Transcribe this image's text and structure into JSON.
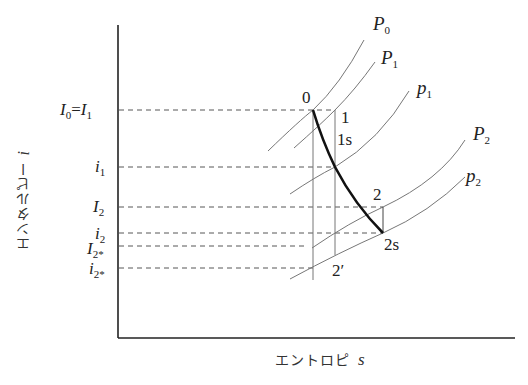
{
  "diagram": {
    "type": "enthalpy-entropy (i-s) diagram",
    "axes": {
      "y_label": "エンタルピー",
      "y_symbol": "i",
      "x_label": "エントロピ",
      "x_symbol": "s"
    },
    "y_levels": [
      {
        "id": "I0_I1",
        "label_main": "I",
        "sub1": "0",
        "eq": "=",
        "label_main2": "I",
        "sub2": "1"
      },
      {
        "id": "i1",
        "label_main": "i",
        "sub1": "1"
      },
      {
        "id": "I2",
        "label_main": "I",
        "sub1": "2"
      },
      {
        "id": "i2",
        "label_main": "i",
        "sub1": "2"
      },
      {
        "id": "I2star",
        "label_main": "I",
        "sub1": "2*"
      },
      {
        "id": "i2star",
        "label_main": "i",
        "sub1": "2*"
      }
    ],
    "curves": [
      {
        "label": "P",
        "sub": "0"
      },
      {
        "label": "P",
        "sub": "1"
      },
      {
        "label": "p",
        "sub": "1"
      },
      {
        "label": "P",
        "sub": "2"
      },
      {
        "label": "p",
        "sub": "2"
      }
    ],
    "points": {
      "p0": "0",
      "p1": "1",
      "p1s": "1s",
      "p2": "2",
      "p2s": "2s",
      "p2prime": "2′"
    }
  }
}
